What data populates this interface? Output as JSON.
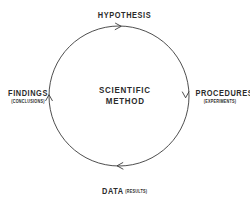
{
  "diagram": {
    "center": {
      "line1": "SCIENTIFIC",
      "line2": "METHOD"
    },
    "flow_direction": "clockwise",
    "stroke_color": "#3a3a3a",
    "text_color": "#2b2b2b",
    "background_color": "#ffffff",
    "circle": {
      "cx": 119,
      "cy": 96,
      "r": 70
    },
    "nodes": [
      {
        "id": "hypothesis",
        "position": "top",
        "label": "HYPOTHESIS",
        "sublabel": ""
      },
      {
        "id": "procedures",
        "position": "right",
        "label": "PROCEDURES",
        "sublabel": "(EXPERIMENTS)"
      },
      {
        "id": "data",
        "position": "bottom",
        "label": "DATA",
        "sublabel": "(RESULTS)"
      },
      {
        "id": "findings",
        "position": "left",
        "label": "FINDINGS",
        "sublabel": "(CONCLUSIONS)"
      }
    ],
    "arrows": [
      {
        "id": "arrow-top",
        "at": "top",
        "points": "right"
      },
      {
        "id": "arrow-right",
        "at": "right",
        "points": "down"
      },
      {
        "id": "arrow-bottom",
        "at": "bottom",
        "points": "left"
      },
      {
        "id": "arrow-left",
        "at": "left",
        "points": "up"
      }
    ]
  }
}
